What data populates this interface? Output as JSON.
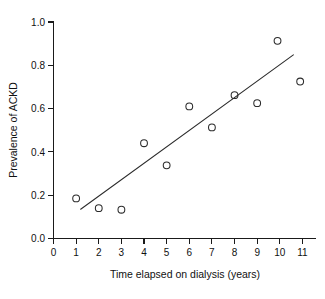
{
  "chart_data": {
    "type": "scatter",
    "title": "",
    "xlabel": "Time elapsed on dialysis (years)",
    "ylabel": "Prevalence of ACKD",
    "xlim": [
      0,
      11.6
    ],
    "ylim": [
      0.0,
      1.0
    ],
    "grid": false,
    "legend": null,
    "xticks": [
      0,
      1,
      2,
      3,
      4,
      5,
      6,
      7,
      8,
      9,
      10,
      11
    ],
    "xticklabels": [
      "0",
      "1",
      "2",
      "3",
      "4",
      "5",
      "6",
      "7",
      "8",
      "9",
      "10",
      "11"
    ],
    "yticks": [
      0.0,
      0.2,
      0.4,
      0.6,
      0.8,
      1.0
    ],
    "yticklabels": [
      "0.0",
      "0.2",
      "0.4",
      "0.6",
      "0.8",
      "1.0"
    ],
    "marker": "open-circle",
    "marker_color": "#2b2b2b",
    "points": [
      {
        "x": 1.0,
        "y": 0.185
      },
      {
        "x": 2.0,
        "y": 0.14
      },
      {
        "x": 3.0,
        "y": 0.133
      },
      {
        "x": 4.0,
        "y": 0.44
      },
      {
        "x": 5.0,
        "y": 0.338
      },
      {
        "x": 6.0,
        "y": 0.61
      },
      {
        "x": 7.0,
        "y": 0.513
      },
      {
        "x": 8.0,
        "y": 0.662
      },
      {
        "x": 9.0,
        "y": 0.625
      },
      {
        "x": 9.9,
        "y": 0.913
      },
      {
        "x": 10.9,
        "y": 0.725
      }
    ],
    "trendline": {
      "type": "linear-fit",
      "color": "#2b2b2b",
      "x_start": 1.2,
      "y_start": 0.135,
      "x_end": 10.6,
      "y_end": 0.848
    }
  }
}
